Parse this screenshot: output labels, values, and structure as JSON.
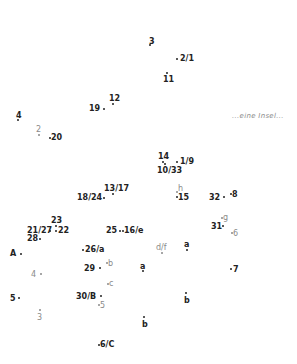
{
  "caption": "...eine Insel...",
  "colors": {
    "primary": "#222222",
    "secondary": "#8a8a8a",
    "background": "#ffffff"
  },
  "points": [
    {
      "label": "3",
      "x": 149,
      "y": 37,
      "dx": 149,
      "dy": 44,
      "style": "dark",
      "label_pos": "above"
    },
    {
      "label": "2/1",
      "x": 180,
      "y": 54,
      "dx": 176,
      "dy": 58,
      "style": "dark",
      "label_pos": "right"
    },
    {
      "label": "11",
      "x": 163,
      "y": 75,
      "dx": 166,
      "dy": 72,
      "style": "dark",
      "label_pos": "below"
    },
    {
      "label": "12",
      "x": 109,
      "y": 94,
      "dx": 112,
      "dy": 103,
      "style": "dark",
      "label_pos": "above"
    },
    {
      "label": "19",
      "x": 89,
      "y": 104,
      "dx": 103,
      "dy": 108,
      "style": "dark",
      "label_pos": "left"
    },
    {
      "label": "4",
      "x": 16,
      "y": 111,
      "dx": 17,
      "dy": 119,
      "style": "dark",
      "label_pos": "above"
    },
    {
      "label": "2",
      "x": 36,
      "y": 125,
      "dx": 38,
      "dy": 134,
      "style": "light",
      "label_pos": "above"
    },
    {
      "label": "20",
      "x": 51,
      "y": 133,
      "dx": 49,
      "dy": 137,
      "style": "dark",
      "label_pos": "right"
    },
    {
      "label": "14",
      "x": 158,
      "y": 152,
      "dx": 162,
      "dy": 161,
      "style": "dark",
      "label_pos": "above"
    },
    {
      "label": "1/9",
      "x": 180,
      "y": 157,
      "dx": 176,
      "dy": 161,
      "style": "dark",
      "label_pos": "right"
    },
    {
      "label": "10/33",
      "x": 157,
      "y": 166,
      "dx": 164,
      "dy": 163,
      "style": "dark",
      "label_pos": "below"
    },
    {
      "label": "13/17",
      "x": 104,
      "y": 184,
      "dx": 112,
      "dy": 193,
      "style": "dark",
      "label_pos": "above"
    },
    {
      "label": "18/24",
      "x": 77,
      "y": 193,
      "dx": 103,
      "dy": 197,
      "style": "dark",
      "label_pos": "left"
    },
    {
      "label": "h",
      "x": 178,
      "y": 184,
      "dx": 176,
      "dy": 191,
      "style": "light",
      "label_pos": "right"
    },
    {
      "label": "15",
      "x": 178,
      "y": 193,
      "dx": 176,
      "dy": 196,
      "style": "dark",
      "label_pos": "right"
    },
    {
      "label": "32",
      "x": 209,
      "y": 193,
      "dx": 223,
      "dy": 196,
      "style": "dark",
      "label_pos": "left"
    },
    {
      "label": "8",
      "x": 232,
      "y": 190,
      "dx": 230,
      "dy": 193,
      "style": "dark",
      "label_pos": "right"
    },
    {
      "label": "g",
      "x": 223,
      "y": 213,
      "dx": 221,
      "dy": 217,
      "style": "light",
      "label_pos": "right"
    },
    {
      "label": "31",
      "x": 211,
      "y": 222,
      "dx": 222,
      "dy": 225,
      "style": "dark",
      "label_pos": "left"
    },
    {
      "label": "6",
      "x": 233,
      "y": 229,
      "dx": 231,
      "dy": 232,
      "style": "light",
      "label_pos": "right"
    },
    {
      "label": "23",
      "x": 51,
      "y": 216,
      "dx": 55,
      "dy": 225,
      "style": "dark",
      "label_pos": "above"
    },
    {
      "label": "21/27",
      "x": 27,
      "y": 226,
      "dx": 49,
      "dy": 230,
      "style": "dark",
      "label_pos": "left"
    },
    {
      "label": "22",
      "x": 58,
      "y": 226,
      "dx": 55,
      "dy": 230,
      "style": "dark",
      "label_pos": "right"
    },
    {
      "label": "28",
      "x": 27,
      "y": 234,
      "dx": 39,
      "dy": 238,
      "style": "dark",
      "label_pos": "left"
    },
    {
      "label": "25",
      "x": 106,
      "y": 226,
      "dx": 119,
      "dy": 230,
      "style": "dark",
      "label_pos": "left"
    },
    {
      "label": "16/e",
      "x": 124,
      "y": 226,
      "dx": 122,
      "dy": 230,
      "style": "dark",
      "label_pos": "right"
    },
    {
      "label": "A",
      "x": 10,
      "y": 249,
      "dx": 20,
      "dy": 253,
      "style": "dark",
      "label_pos": "left"
    },
    {
      "label": "26/a",
      "x": 85,
      "y": 245,
      "dx": 82,
      "dy": 249,
      "style": "dark",
      "label_pos": "right"
    },
    {
      "label": "d/f",
      "x": 156,
      "y": 243,
      "dx": 161,
      "dy": 252,
      "style": "light",
      "label_pos": "above"
    },
    {
      "label": "a",
      "x": 184,
      "y": 240,
      "dx": 186,
      "dy": 249,
      "style": "dark",
      "label_pos": "above"
    },
    {
      "label": "b",
      "x": 108,
      "y": 259,
      "dx": 106,
      "dy": 262,
      "style": "light",
      "label_pos": "right"
    },
    {
      "label": "29",
      "x": 84,
      "y": 264,
      "dx": 99,
      "dy": 267,
      "style": "dark",
      "label_pos": "left"
    },
    {
      "label": "a",
      "x": 140,
      "y": 262,
      "dx": 142,
      "dy": 270,
      "style": "dark",
      "label_pos": "above"
    },
    {
      "label": "4",
      "x": 31,
      "y": 270,
      "dx": 40,
      "dy": 273,
      "style": "light",
      "label_pos": "left"
    },
    {
      "label": "7",
      "x": 233,
      "y": 265,
      "dx": 230,
      "dy": 268,
      "style": "dark",
      "label_pos": "right"
    },
    {
      "label": "c",
      "x": 109,
      "y": 279,
      "dx": 107,
      "dy": 283,
      "style": "light",
      "label_pos": "right"
    },
    {
      "label": "30/B",
      "x": 76,
      "y": 292,
      "dx": 100,
      "dy": 295,
      "style": "dark",
      "label_pos": "left"
    },
    {
      "label": "b",
      "x": 184,
      "y": 296,
      "dx": 185,
      "dy": 292,
      "style": "dark",
      "label_pos": "below"
    },
    {
      "label": "5",
      "x": 10,
      "y": 294,
      "dx": 18,
      "dy": 297,
      "style": "dark",
      "label_pos": "left"
    },
    {
      "label": "5",
      "x": 100,
      "y": 301,
      "dx": 98,
      "dy": 304,
      "style": "light",
      "label_pos": "right"
    },
    {
      "label": "3",
      "x": 37,
      "y": 313,
      "dx": 39,
      "dy": 309,
      "style": "light",
      "label_pos": "below"
    },
    {
      "label": "b",
      "x": 142,
      "y": 320,
      "dx": 143,
      "dy": 316,
      "style": "dark",
      "label_pos": "below"
    },
    {
      "label": "6/C",
      "x": 100,
      "y": 340,
      "dx": 98,
      "dy": 344,
      "style": "dark",
      "label_pos": "right"
    }
  ]
}
